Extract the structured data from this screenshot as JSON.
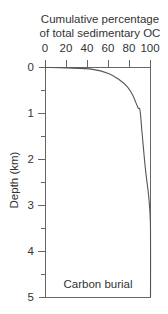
{
  "chart_data": {
    "type": "line",
    "title": "Cumulative percentage of total sedimentary OC",
    "title_lines": [
      "Cumulative percentage",
      "of total sedimentary OC"
    ],
    "xlabel": "Cumulative percentage of total sedimentary OC",
    "ylabel": "Depth (km)",
    "annotation": "Carbon burial",
    "x_axis_position": "top",
    "y_axis_inverted": true,
    "xlim": [
      0,
      100
    ],
    "ylim": [
      0,
      5
    ],
    "x_ticks": [
      0,
      20,
      40,
      60,
      80,
      100
    ],
    "x_tick_labels": [
      "0",
      "20",
      "40",
      "60",
      "80",
      "100"
    ],
    "y_ticks": [
      0,
      1,
      2,
      3,
      4,
      5
    ],
    "y_tick_labels": [
      "0",
      "1",
      "2",
      "3",
      "4",
      "5"
    ],
    "y_minor_ticks": [
      0.5,
      1.5,
      2.5,
      3.5,
      4.5
    ],
    "grid": false,
    "legend": null,
    "series": [
      {
        "name": "Carbon burial",
        "color": "#555555",
        "x": [
          0,
          20,
          45,
          60,
          70,
          78,
          83,
          88,
          90,
          92,
          95,
          98,
          99,
          100,
          100
        ],
        "y": [
          0,
          0.01,
          0.04,
          0.13,
          0.26,
          0.42,
          0.6,
          0.87,
          0.93,
          1.43,
          2.17,
          2.74,
          3.0,
          3.5,
          5.0
        ]
      }
    ]
  }
}
